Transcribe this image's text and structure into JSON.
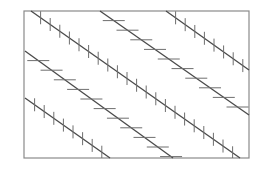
{
  "figure": {
    "width": 267,
    "height": 179,
    "background": "#ffffff",
    "frame": {
      "x1": 24,
      "y1": 11,
      "x2": 249,
      "y2": 158,
      "color": "#8a8a8a",
      "width": 1.2
    },
    "line_color": "#4a4a4a",
    "tick_color": "#6e6e6e",
    "tick_spacing": 9.6,
    "lines": [
      {
        "id": "A",
        "tick_orientation": "vertical",
        "x1": 31,
        "y1": 11,
        "x2": 240,
        "y2": 158,
        "tick_len": 13
      },
      {
        "id": "B",
        "tick_orientation": "horizontal",
        "x1": 25,
        "y1": 51,
        "x2": 173,
        "y2": 158,
        "tick_len": 22
      },
      {
        "id": "C",
        "tick_orientation": "vertical",
        "x1": 25,
        "y1": 98,
        "x2": 110,
        "y2": 158,
        "tick_len": 13
      },
      {
        "id": "D",
        "tick_orientation": "horizontal",
        "x1": 100,
        "y1": 11,
        "x2": 249,
        "y2": 115,
        "tick_len": 22
      },
      {
        "id": "E",
        "tick_orientation": "vertical",
        "x1": 166,
        "y1": 11,
        "x2": 249,
        "y2": 70,
        "tick_len": 13
      }
    ]
  }
}
